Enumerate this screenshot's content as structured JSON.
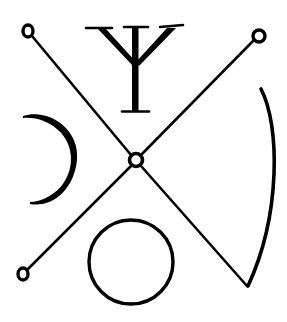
{
  "diagram": {
    "type": "sigil",
    "description": "Occult-style seal: an X of two diagonal lines with small ring terminals and a central ring, a trident/psi glyph at top, a crescent on the left, a circle at bottom, and a curved arc on the right joining the lower-right diagonal.",
    "colors": {
      "ink": "#000000",
      "background": "#ffffff"
    },
    "elements": [
      {
        "id": "diagonal-a",
        "shape": "line",
        "from": [
          28,
          32
        ],
        "to": [
          247,
          286
        ]
      },
      {
        "id": "diagonal-b",
        "shape": "line",
        "from": [
          258,
          36
        ],
        "to": [
          24,
          273
        ]
      },
      {
        "id": "ring-top-left",
        "shape": "ring",
        "center": [
          28,
          31
        ],
        "r": 5
      },
      {
        "id": "ring-top-right",
        "shape": "ring",
        "center": [
          259,
          36
        ],
        "r": 6
      },
      {
        "id": "ring-bottom-left",
        "shape": "ring",
        "center": [
          23,
          274
        ],
        "r": 5
      },
      {
        "id": "ring-center",
        "shape": "ring",
        "center": [
          136,
          160
        ],
        "r": 6
      },
      {
        "id": "psi-glyph",
        "shape": "trident",
        "top_y": 28,
        "bottom_y": 112,
        "center_x": 136
      },
      {
        "id": "crescent-left",
        "shape": "crescent",
        "from": [
          23,
          115
        ],
        "to": [
          30,
          204
        ],
        "apex_x": 77
      },
      {
        "id": "circle-bottom",
        "shape": "circle",
        "center": [
          131,
          262
        ],
        "r": 42
      },
      {
        "id": "arc-right",
        "shape": "arc",
        "from": [
          261,
          89
        ],
        "to": [
          248,
          286
        ],
        "apex_x": 276
      }
    ]
  }
}
